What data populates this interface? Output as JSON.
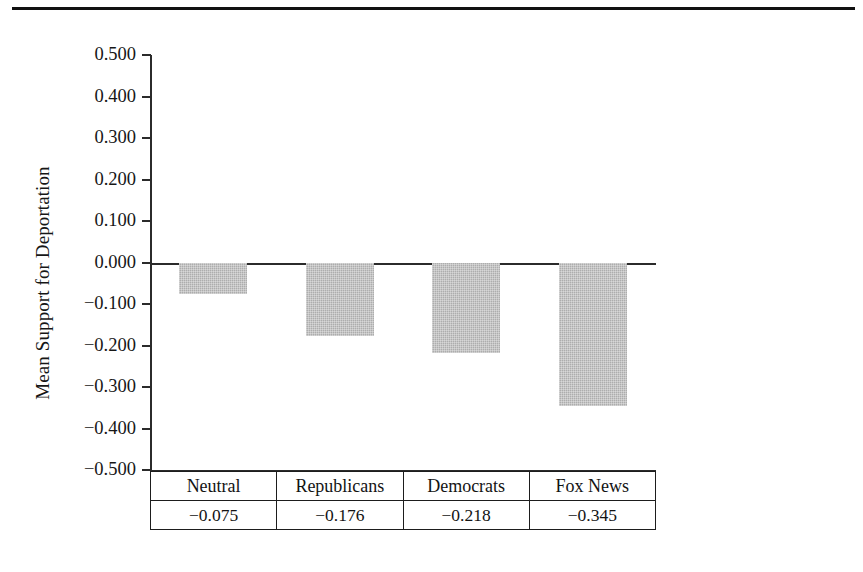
{
  "figure": {
    "top_rule": true,
    "y_axis_title": "Mean Support for Deportation"
  },
  "chart_data": {
    "type": "bar",
    "title": "",
    "subtitle": "",
    "xlabel": "",
    "ylabel": "Mean Support for Deportation",
    "categories": [
      "Neutral",
      "Republicans",
      "Democrats",
      "Fox News"
    ],
    "values": [
      -0.075,
      -0.176,
      -0.218,
      -0.345
    ],
    "value_labels": [
      "−0.075",
      "−0.176",
      "−0.218",
      "−0.345"
    ],
    "series": [
      {
        "name": "Mean Support for Deportation",
        "values": [
          -0.075,
          -0.176,
          -0.218,
          -0.345
        ]
      }
    ],
    "ylim": [
      -0.5,
      0.5
    ],
    "ytick_values": [
      0.5,
      0.4,
      0.3,
      0.2,
      0.1,
      0.0,
      -0.1,
      -0.2,
      -0.3,
      -0.4,
      -0.5
    ],
    "ytick_labels": [
      "0.500",
      "0.400",
      "0.300",
      "0.200",
      "0.100",
      "0.000",
      "−0.100",
      "−0.200",
      "−0.300",
      "−0.400",
      "−0.500"
    ],
    "grid": false,
    "legend": null,
    "legend_position": "none",
    "bar_color": "#adadad",
    "axis_color": "#2b2b2b",
    "baseline": 0.0
  },
  "table": {
    "header_row": [
      "Neutral",
      "Republicans",
      "Democrats",
      "Fox News"
    ],
    "value_row": [
      "−0.075",
      "−0.176",
      "−0.218",
      "−0.345"
    ]
  }
}
